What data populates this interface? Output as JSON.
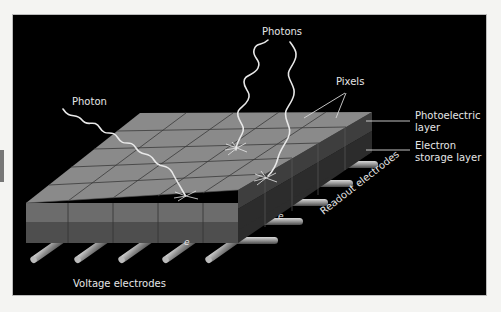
{
  "diagram": {
    "type": "ccd-sensor-cross-section",
    "labels": {
      "photons": "Photons",
      "photon": "Photon",
      "pixels": "Pixels",
      "photoelectric_line1": "Photoelectric",
      "photoelectric_line2": "layer",
      "electron_line1": "Electron",
      "electron_line2": "storage layer",
      "readout": "Readout electrodes",
      "voltage": "Voltage electrodes",
      "electron_symbol_1": "e",
      "electron_symbol_2": "e"
    },
    "colors": {
      "background": "#000000",
      "page": "#f4f4f2",
      "top_face": "#8a8a8a",
      "front_upper": "#6c6c6c",
      "front_lower": "#4e4e4e",
      "side_upper": "#3e3e3e",
      "side_lower": "#2c2c2c",
      "grid_line": "#3a3a3a",
      "photon_wave": "#e8e8e8",
      "electrode": "#9a9a9a",
      "label_text": "#e6e6e6"
    },
    "grid": {
      "columns": 5,
      "rows": 5
    },
    "voltage_electrode_count": 5,
    "readout_electrode_count": 5
  }
}
